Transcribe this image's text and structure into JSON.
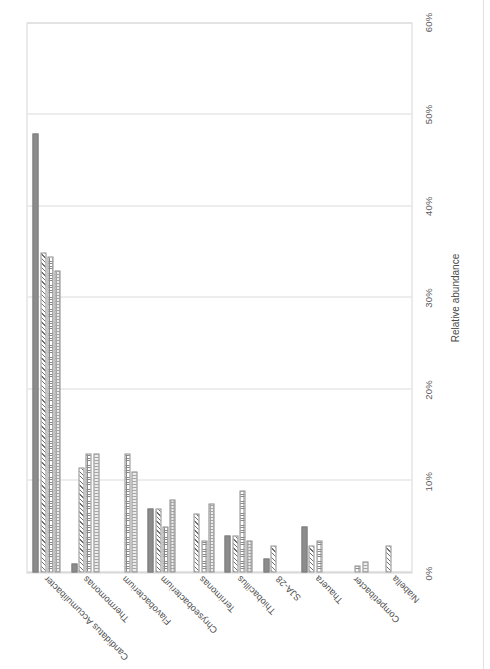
{
  "figure": {
    "axis_title": "Relative abundance",
    "tick_labels": [
      "0%",
      "10%",
      "20%",
      "30%",
      "40%",
      "50%",
      "60%"
    ]
  },
  "chart_data": {
    "type": "bar",
    "orientation": "horizontal",
    "title": "",
    "xlabel": "Relative abundance",
    "ylabel": "",
    "xlim": [
      0,
      60
    ],
    "xticks": [
      0,
      10,
      20,
      30,
      40,
      50,
      60
    ],
    "tick_format": "percent",
    "grid": true,
    "legend": "none",
    "categories": [
      "Candidatus Accumulibacter",
      "Thermomonas",
      "Flavobacterium",
      "Chryseobacterium",
      "Terrimonas",
      "Thiobacillus",
      "SJA-28",
      "Thauera",
      "Competibacter",
      "Niabella"
    ],
    "series": [
      {
        "name": "series-1",
        "pattern": "solid",
        "color": "#8c8c8c",
        "values": [
          48.0,
          1.0,
          0.0,
          7.0,
          0.0,
          4.0,
          1.5,
          5.0,
          0.0,
          0.0
        ]
      },
      {
        "name": "series-2",
        "pattern": "diagonal-hatch",
        "color": "#6f6f6f",
        "values": [
          35.0,
          11.5,
          0.0,
          7.0,
          6.5,
          4.0,
          3.0,
          3.0,
          0.0,
          3.0
        ]
      },
      {
        "name": "series-3",
        "pattern": "grid-hatch",
        "color": "#8a8a8a",
        "values": [
          34.5,
          13.0,
          13.0,
          5.0,
          3.5,
          9.0,
          0.0,
          3.5,
          0.8,
          0.0
        ]
      },
      {
        "name": "series-4",
        "pattern": "dotted",
        "color": "#a5a5a5",
        "values": [
          33.0,
          13.0,
          11.0,
          8.0,
          7.5,
          3.5,
          0.0,
          0.0,
          1.2,
          0.0
        ]
      }
    ]
  }
}
